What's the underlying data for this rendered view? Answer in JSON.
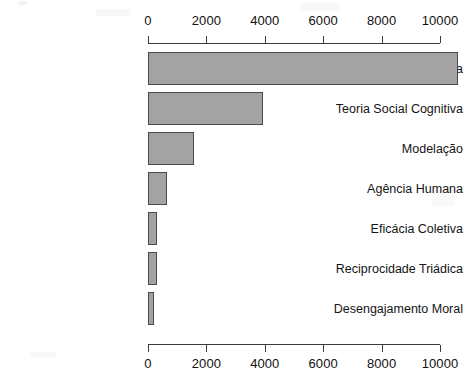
{
  "chart_data": {
    "type": "bar",
    "orientation": "horizontal",
    "title": "",
    "subtitle": "",
    "xlabel": "",
    "ylabel": "",
    "xlim": [
      0,
      10600
    ],
    "grid": false,
    "legend": false,
    "legend_position": "none",
    "axis_ticks_top": true,
    "axis_ticks_bottom": true,
    "tick_values": [
      0,
      2000,
      4000,
      6000,
      8000,
      10000
    ],
    "tick_labels": [
      "0",
      "2000",
      "4000",
      "6000",
      "8000",
      "10000"
    ],
    "categories": [
      "Autoeficácia",
      "Teoria Social Cognitiva",
      "Modelação",
      "Agência Humana",
      "Eficácia Coletiva",
      "Reciprocidade Triádica",
      "Desengajamento Moral"
    ],
    "values": [
      10600,
      3940,
      1575,
      650,
      310,
      310,
      200
    ],
    "bar_color": "#a3a3a3",
    "bar_border_color": "#4a4a4a",
    "axis_color": "#3c3c3c",
    "text_color": "#141414",
    "background_color": "#ffffff"
  },
  "layout": {
    "plot_left_px": 148,
    "plot_right_px": 440,
    "axis_top_y_px": 43,
    "axis_bottom_y_px": 344,
    "bar_height_px": 33,
    "bar_pitch_px": 40,
    "first_bar_top_px": 52
  }
}
